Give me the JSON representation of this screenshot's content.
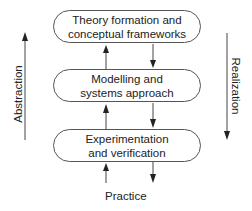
{
  "diagram": {
    "boxes": [
      {
        "line1": "Theory formation and",
        "line2": "conceptual frameworks"
      },
      {
        "line1": "Modelling and",
        "line2": "systems approach"
      },
      {
        "line1": "Experimentation",
        "line2": "and verification"
      }
    ],
    "left_axis_label": "Abstraction",
    "right_axis_label": "Realization",
    "bottom_label": "Practice"
  }
}
